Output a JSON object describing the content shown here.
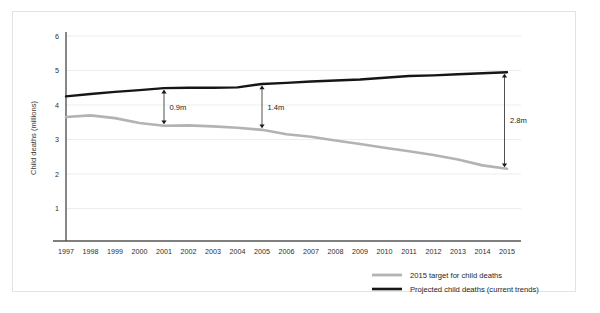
{
  "chart_data": {
    "type": "line",
    "title": "",
    "xlabel": "",
    "ylabel": "Child deaths (millions)",
    "grid": true,
    "legend_position": "bottom-right",
    "xlim": [
      1997,
      2015
    ],
    "ylim": [
      0,
      6.4
    ],
    "yticks": [
      1,
      2,
      3,
      4,
      5,
      6
    ],
    "ytick_labels": [
      "1",
      "2",
      "3",
      "4",
      "5",
      "6"
    ],
    "x": [
      1997,
      1998,
      1999,
      2000,
      2001,
      2002,
      2003,
      2004,
      2005,
      2006,
      2007,
      2008,
      2009,
      2010,
      2011,
      2012,
      2013,
      2014,
      2015
    ],
    "xtick_labels": [
      "1997",
      "1998",
      "1999",
      "2000",
      "2001",
      "2002",
      "2003",
      "2004",
      "2005",
      "2006",
      "2007",
      "2008",
      "2009",
      "2010",
      "2011",
      "2012",
      "2013",
      "2014",
      "2015"
    ],
    "series": [
      {
        "name": "2015 target for child deaths",
        "color": "#b3b3b3",
        "width": 2.6,
        "values": [
          3.65,
          3.7,
          3.62,
          3.48,
          3.4,
          3.41,
          3.38,
          3.34,
          3.28,
          3.15,
          3.08,
          2.97,
          2.87,
          2.76,
          2.66,
          2.55,
          2.42,
          2.25,
          2.15
        ]
      },
      {
        "name": "Projected child deaths (current trends)",
        "color": "#161616",
        "width": 2.4,
        "values": [
          4.25,
          4.32,
          4.38,
          4.43,
          4.49,
          4.5,
          4.5,
          4.51,
          4.61,
          4.64,
          4.68,
          4.71,
          4.74,
          4.79,
          4.84,
          4.86,
          4.89,
          4.92,
          4.95
        ]
      }
    ],
    "annotations": [
      {
        "label": "0.9m",
        "x": 2001,
        "y_top": 4.49,
        "y_bottom": 3.4
      },
      {
        "label": "1.4m",
        "x": 2005,
        "y_top": 4.61,
        "y_bottom": 3.28
      },
      {
        "label": "2.8m",
        "x": 2015,
        "y_top": 4.95,
        "y_bottom": 2.15
      }
    ]
  },
  "legend": {
    "items": [
      {
        "label": "2015 target for child deaths",
        "color": "#b3b3b3"
      },
      {
        "label": "Projected child deaths (current trends)",
        "color": "#161616"
      }
    ]
  },
  "colors": {
    "target_line": "#b3b3b3",
    "projected_line": "#161616",
    "grid": "#ededed",
    "axis": "#555555",
    "frame": "#e3e3e3"
  }
}
